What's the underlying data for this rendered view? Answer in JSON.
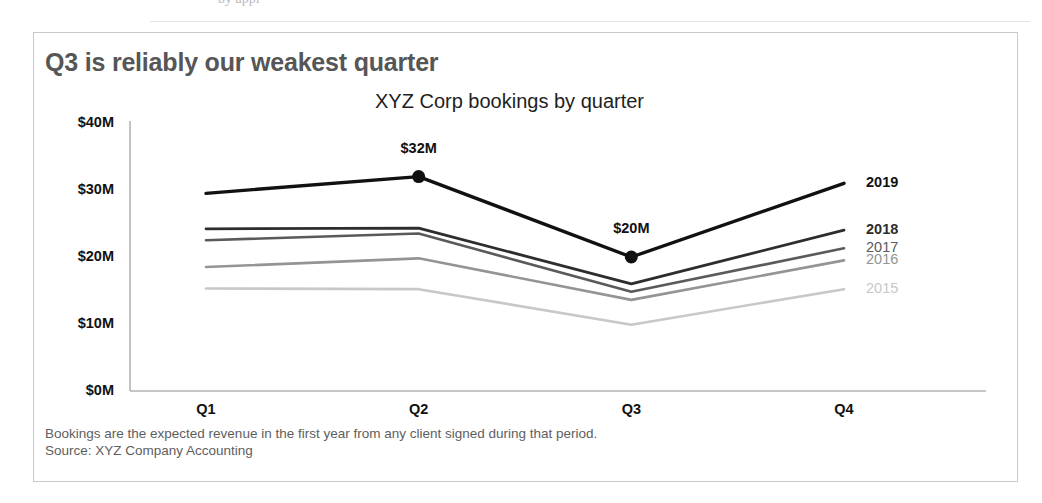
{
  "figure": {
    "title": "Q3 is reliably our weakest quarter",
    "subtitle": "XYZ Corp bookings by quarter",
    "footnote_line1": "Bookings are the expected revenue in the first year from any client signed during that period.",
    "footnote_line2": "Source: XYZ Company Accounting"
  },
  "page_artifact": {
    "fragment_left": "by appl",
    "fragment_right": "————"
  },
  "colors": {
    "series_2019": "#111111",
    "series_2018": "#2d2d2d",
    "series_2017": "#5a5a5a",
    "series_2016": "#949494",
    "series_2015": "#c8c8c8",
    "axis": "#b5b5b5",
    "title": "#565656",
    "footnote": "#5e5e5e",
    "frame": "#c9c9cc"
  },
  "chart_data": {
    "type": "line",
    "title": "Q3 is reliably our weakest quarter",
    "subtitle": "XYZ Corp bookings by quarter",
    "xlabel": "",
    "ylabel": "",
    "categories": [
      "Q1",
      "Q2",
      "Q3",
      "Q4"
    ],
    "ylim": [
      0,
      40
    ],
    "y_ticks": [
      0,
      10,
      20,
      30,
      40
    ],
    "y_tick_labels": [
      "$0M",
      "$10M",
      "$20M",
      "$30M",
      "$40M"
    ],
    "y_unit": "M",
    "grid": false,
    "legend_position": "right-inline-labels",
    "series": [
      {
        "name": "2019",
        "label": "2019",
        "color": "#111111",
        "width": 3.4,
        "values": [
          29.5,
          32,
          20,
          31
        ],
        "markers": [
          false,
          true,
          true,
          false
        ],
        "emphasis": true
      },
      {
        "name": "2018",
        "label": "2018",
        "color": "#2d2d2d",
        "width": 2.8,
        "values": [
          24.2,
          24.3,
          16,
          24
        ],
        "markers": [
          false,
          false,
          false,
          false
        ],
        "emphasis": false
      },
      {
        "name": "2017",
        "label": "2017",
        "color": "#5a5a5a",
        "width": 2.6,
        "values": [
          22.5,
          23.5,
          14.8,
          21.3
        ],
        "markers": [
          false,
          false,
          false,
          false
        ],
        "emphasis": false
      },
      {
        "name": "2016",
        "label": "2016",
        "color": "#949494",
        "width": 2.6,
        "values": [
          18.5,
          19.8,
          13.6,
          19.5
        ],
        "markers": [
          false,
          false,
          false,
          false
        ],
        "emphasis": false
      },
      {
        "name": "2015",
        "label": "2015",
        "color": "#c8c8c8",
        "width": 2.6,
        "values": [
          15.3,
          15.2,
          9.9,
          15.2
        ],
        "markers": [
          false,
          false,
          false,
          false
        ],
        "emphasis": false
      }
    ],
    "annotations": [
      {
        "text": "$32M",
        "series": "2019",
        "category": "Q2",
        "value": 32
      },
      {
        "text": "$20M",
        "series": "2019",
        "category": "Q3",
        "value": 20
      }
    ]
  }
}
